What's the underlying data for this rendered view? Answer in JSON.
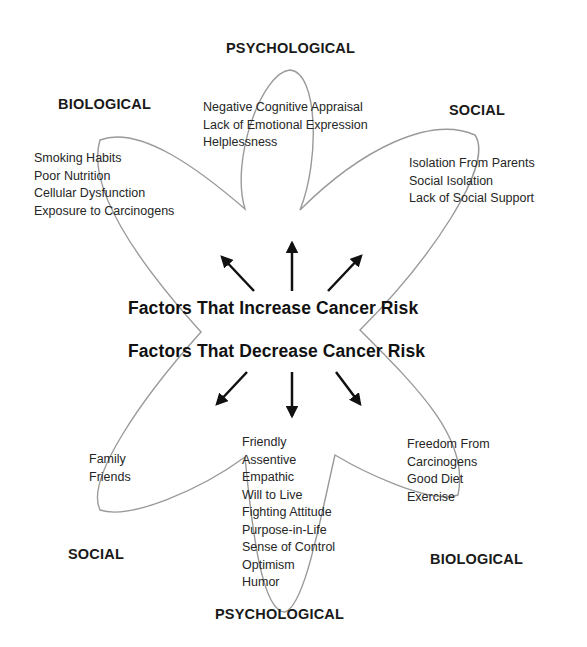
{
  "center": {
    "increase_title": "Factors That Increase Cancer Risk",
    "decrease_title": "Factors That Decrease Cancer Risk"
  },
  "increase": {
    "psychological": {
      "heading": "PSYCHOLOGICAL",
      "items": [
        "Negative Cognitive Appraisal",
        "Lack of Emotional Expression",
        "Helplessness"
      ]
    },
    "biological": {
      "heading": "BIOLOGICAL",
      "items": [
        "Smoking Habits",
        "Poor Nutrition",
        "Cellular Dysfunction",
        "Exposure to Carcinogens"
      ]
    },
    "social": {
      "heading": "SOCIAL",
      "items": [
        "Isolation From Parents",
        "Social Isolation",
        "Lack of Social Support"
      ]
    }
  },
  "decrease": {
    "social": {
      "heading": "SOCIAL",
      "items": [
        "Family",
        "Friends"
      ]
    },
    "psychological": {
      "heading": "PSYCHOLOGICAL",
      "items": [
        "Friendly",
        "Assentive",
        "Empathic",
        "Will to Live",
        "Fighting Attitude",
        "Purpose-in-Life",
        "Sense of Control",
        "Optimism",
        "Humor"
      ]
    },
    "biological": {
      "heading": "BIOLOGICAL",
      "items": [
        "Freedom From",
        "Carcinogens",
        "Good Diet",
        "Exercise"
      ]
    }
  },
  "colors": {
    "outline": "#9a9a9a",
    "arrow": "#111111",
    "text": "#222222"
  },
  "icons": {
    "arrows_up": [
      "arrow-up-left-icon",
      "arrow-up-icon",
      "arrow-up-right-icon"
    ],
    "arrows_down": [
      "arrow-down-left-icon",
      "arrow-down-icon",
      "arrow-down-right-icon"
    ]
  }
}
